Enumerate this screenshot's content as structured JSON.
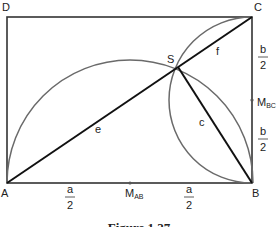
{
  "points": {
    "A": {
      "label": "A",
      "x": 7,
      "y": 183
    },
    "B": {
      "label": "B",
      "x": 252,
      "y": 183
    },
    "C": {
      "label": "C",
      "x": 252,
      "y": 17
    },
    "D": {
      "label": "D",
      "x": 7,
      "y": 17
    },
    "S": {
      "label": "S",
      "x": 178,
      "y": 67
    },
    "M_AB": {
      "label": "M",
      "sub": "AB",
      "x": 130,
      "y": 183
    },
    "M_BC": {
      "label": "M",
      "sub": "BC",
      "x": 252,
      "y": 100
    }
  },
  "segments": {
    "e": "e",
    "f": "f",
    "c": "c"
  },
  "fractions": {
    "a_half_left": {
      "num": "a",
      "den": "2"
    },
    "a_half_right": {
      "num": "a",
      "den": "2"
    },
    "b_half_top": {
      "num": "b",
      "den": "2"
    },
    "b_half_bottom": {
      "num": "b",
      "den": "2"
    }
  },
  "caption": "Figure 1.27",
  "colors": {
    "rect": "#222222",
    "arc": "#666666",
    "diagonal": "#111111"
  }
}
